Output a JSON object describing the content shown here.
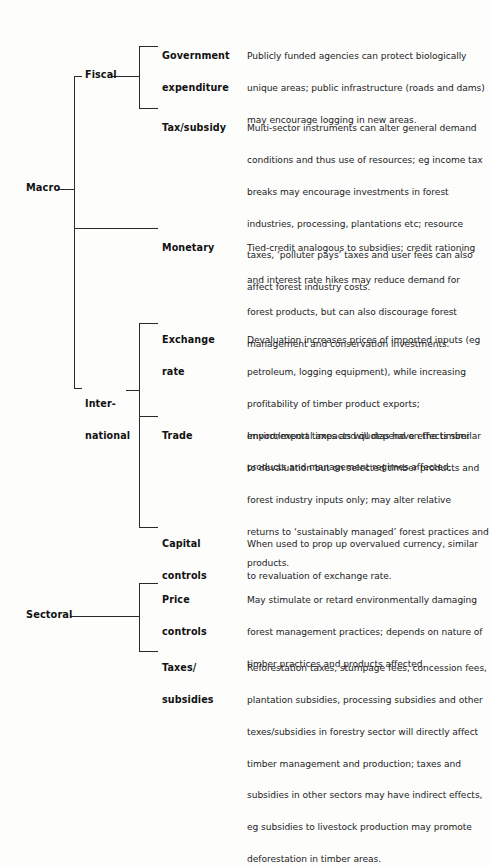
{
  "diagram": {
    "roots": [
      {
        "label": "Macro"
      },
      {
        "label": "Sectoral"
      }
    ],
    "groups": [
      {
        "label": "Fiscal"
      },
      {
        "label_lines": [
          "Inter-",
          "national"
        ]
      }
    ],
    "items": [
      {
        "label_lines": [
          "Government",
          "expenditure"
        ],
        "description_lines": [
          "Publicly funded agencies can protect biologically",
          "unique areas; public infrastructure (roads and dams)",
          "may encourage logging in new areas."
        ]
      },
      {
        "label_lines": [
          "Tax/subsidy"
        ],
        "description_lines": [
          "Multi-sector instruments can alter general demand",
          "conditions and thus use of resources; eg income tax",
          "breaks may encourage investments in forest",
          "industries, processing, plantations etc; resource",
          "taxes, ‘polluter pays’ taxes and user fees can also",
          "affect forest industry costs."
        ]
      },
      {
        "label_lines": [
          "Monetary"
        ],
        "description_lines": [
          "Tied-credit analogous to subsidies; credit rationing",
          "and interest rate hikes may reduce demand for",
          "forest products, but can also discourage forest",
          "management and conservation investments."
        ]
      },
      {
        "label_lines": [
          "Exchange",
          "rate"
        ],
        "description_lines": [
          "Devaluation increases prices of imported inputs (eg",
          "petroleum, logging equipment), while increasing",
          "profitability of timber product exports;",
          "environmental impacts will depend on the timber",
          "products and management regimes affected."
        ]
      },
      {
        "label_lines": [
          "Trade"
        ],
        "description_lines": [
          "Import/export taxes and quotas have effects similar",
          "to devaluation but on selected timber products and",
          "forest industry inputs only; may alter relative",
          "returns to ‘sustainably managed’ forest practices and",
          "products."
        ]
      },
      {
        "label_lines": [
          "Capital",
          "controls"
        ],
        "description_lines": [
          "When used to prop up overvalued currency, similar",
          "to revaluation of exchange rate."
        ]
      },
      {
        "label_lines": [
          "Price",
          "controls"
        ],
        "description_lines": [
          "May stimulate or retard environmentally damaging",
          "forest management practices; depends on nature of",
          "timber practices and products affected."
        ]
      },
      {
        "label_lines": [
          "Taxes/",
          "subsidies"
        ],
        "description_lines": [
          "Reforestation taxes, stumpage fees, concession fees,",
          "plantation subsidies, processing subsidies and other",
          "texes/subsidies in forestry sector will directly affect",
          "timber management and production; taxes and",
          "subsidies in other sectors may have indirect effects,",
          "eg subsidies to livestock production may promote",
          "deforestation in timber areas."
        ]
      }
    ]
  }
}
